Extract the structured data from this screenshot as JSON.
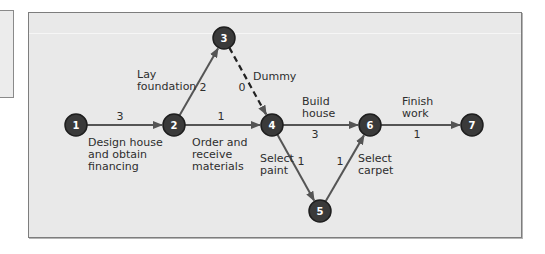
{
  "diagram": {
    "type": "activity-on-arrow network",
    "colors": {
      "node_fill": "#3a3a3a",
      "node_stroke": "#1e1e1e",
      "arrow": "#555555",
      "background": "#e9e9e9"
    },
    "nodes": [
      {
        "id": "1",
        "label": "1"
      },
      {
        "id": "2",
        "label": "2"
      },
      {
        "id": "3",
        "label": "3"
      },
      {
        "id": "4",
        "label": "4"
      },
      {
        "id": "5",
        "label": "5"
      },
      {
        "id": "6",
        "label": "6"
      },
      {
        "id": "7",
        "label": "7"
      }
    ],
    "activities": [
      {
        "from": "1",
        "to": "2",
        "name": "Design house and obtain financing",
        "lines": [
          "Design house",
          "and obtain",
          "financing"
        ],
        "duration": "3",
        "dummy": false
      },
      {
        "from": "2",
        "to": "3",
        "name": "Lay foundation",
        "lines": [
          "Lay",
          "foundation"
        ],
        "duration": "2",
        "dummy": false
      },
      {
        "from": "2",
        "to": "4",
        "name": "Order and receive materials",
        "lines": [
          "Order and",
          "receive",
          "materials"
        ],
        "duration": "1",
        "dummy": false
      },
      {
        "from": "3",
        "to": "4",
        "name": "Dummy",
        "lines": [
          "Dummy"
        ],
        "duration": "0",
        "dummy": true
      },
      {
        "from": "4",
        "to": "6",
        "name": "Build house",
        "lines": [
          "Build",
          "house"
        ],
        "duration": "3",
        "dummy": false
      },
      {
        "from": "4",
        "to": "5",
        "name": "Select paint",
        "lines": [
          "Select",
          "paint"
        ],
        "duration": "1",
        "dummy": false
      },
      {
        "from": "5",
        "to": "6",
        "name": "Select carpet",
        "lines": [
          "Select",
          "carpet"
        ],
        "duration": "1",
        "dummy": false
      },
      {
        "from": "6",
        "to": "7",
        "name": "Finish work",
        "lines": [
          "Finish",
          "work"
        ],
        "duration": "1",
        "dummy": false
      }
    ]
  }
}
